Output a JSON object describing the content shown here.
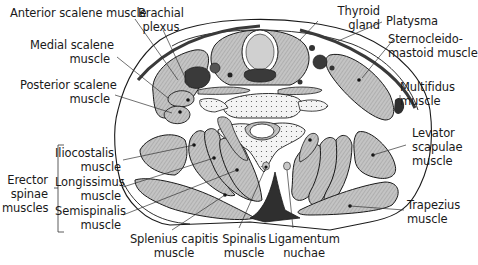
{
  "diagram": {
    "colors": {
      "muscle_fill": "#b9b9b9",
      "dark_fill": "#3a3a3a",
      "outline": "#1a1a1a",
      "background": "#ffffff",
      "bone_fill": "#f2f2f2"
    }
  },
  "labels": {
    "anterior_scalene": "Anterior scalene muscle",
    "brachial_plexus": [
      "Brachial",
      "plexus"
    ],
    "thyroid_gland": [
      "Thyroid",
      "gland"
    ],
    "platysma": "Platysma",
    "medial_scalene": [
      "Medial scalene",
      "muscle"
    ],
    "sternocleidomastoid": [
      "Sternocleido-",
      "mastoid muscle"
    ],
    "posterior_scalene": [
      "Posterior scalene",
      "muscle"
    ],
    "multifidus": [
      "Multifidus",
      "muscle"
    ],
    "levator_scapulae": [
      "Levator",
      "scapulae",
      "muscle"
    ],
    "erector_spinae": [
      "Erector",
      "spinae",
      "muscles"
    ],
    "iliocostalis": [
      "Iliocostalis",
      "muscle"
    ],
    "longissimus": [
      "Longissimus",
      "muscle"
    ],
    "semispinalis": [
      "Semispinalis",
      "muscle"
    ],
    "trapezius": [
      "Trapezius",
      "muscle"
    ],
    "splenius_capitis": [
      "Splenius capitis",
      "muscle"
    ],
    "spinalis": [
      "Spinalis",
      "muscle"
    ],
    "ligamentum_nuchae": [
      "Ligamentum",
      "nuchae"
    ]
  }
}
